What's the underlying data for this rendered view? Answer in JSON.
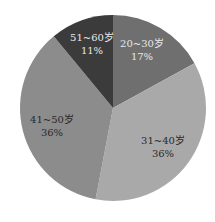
{
  "chart_data": {
    "type": "pie",
    "title": "",
    "start_angle_deg": 0,
    "direction": "clockwise",
    "categories": [
      "20~30岁",
      "31~40岁",
      "41~50岁",
      "51~60岁"
    ],
    "values": [
      17,
      36,
      36,
      11
    ],
    "value_labels": [
      "17%",
      "36%",
      "36%",
      "11%"
    ],
    "colors": [
      "#6f6f6f",
      "#a9a9a9",
      "#8c8c8c",
      "#3b3b3b"
    ],
    "legend": "none",
    "labels_inside": true
  },
  "slices": [
    {
      "name": "20~30岁",
      "pct": "17%"
    },
    {
      "name": "31~40岁",
      "pct": "36%"
    },
    {
      "name": "41~50岁",
      "pct": "36%"
    },
    {
      "name": "51~60岁",
      "pct": "11%"
    }
  ]
}
